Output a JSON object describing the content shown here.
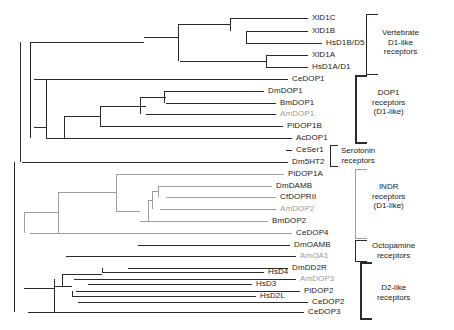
{
  "figure": {
    "type": "phylogenetic-tree",
    "width": 454,
    "height": 330,
    "colors": {
      "branch_dark": "#2b2b2b",
      "branch_gray": "#9d9d9d",
      "label_dark": "#1c1c1c",
      "label_gray": "#9a9a9a",
      "background": "#ffffff"
    }
  },
  "taxa": [
    {
      "id": "t0",
      "label": "XlD1C",
      "y": 18,
      "tip_x": 308,
      "label_x": 312,
      "color": "dark",
      "group": "vertebrate_d1"
    },
    {
      "id": "t1",
      "label": "XlD1B",
      "y": 31,
      "tip_x": 308,
      "label_x": 312,
      "color": "dark",
      "group": "vertebrate_d1"
    },
    {
      "id": "t2",
      "label": "HsD1B/D5",
      "y": 43,
      "tip_x": 322,
      "label_x": 326,
      "color": "dark",
      "group": "vertebrate_d1"
    },
    {
      "id": "t3",
      "label": "XlD1A",
      "y": 55,
      "tip_x": 308,
      "label_x": 312,
      "color": "dark",
      "group": "vertebrate_d1"
    },
    {
      "id": "t4",
      "label": "HsD1A/D1",
      "y": 67,
      "tip_x": 308,
      "label_x": 312,
      "color": "dark",
      "group": "vertebrate_d1"
    },
    {
      "id": "t5",
      "label": "CeDOP1",
      "y": 79,
      "tip_x": 288,
      "label_x": 292,
      "color": "dark",
      "group": "dop1"
    },
    {
      "id": "t6",
      "label": "DmDOP1",
      "y": 91,
      "tip_x": 264,
      "label_x": 268,
      "color": "dark",
      "group": "dop1"
    },
    {
      "id": "t7",
      "label": "BmDOP1",
      "y": 103,
      "tip_x": 276,
      "label_x": 280,
      "color": "dark",
      "group": "dop1"
    },
    {
      "id": "t8",
      "label": "AmDOP1",
      "y": 114,
      "tip_x": 276,
      "label_x": 280,
      "color": "gray",
      "group": "dop1"
    },
    {
      "id": "t9",
      "label": "PiDOP1B",
      "y": 126,
      "tip_x": 283,
      "label_x": 287,
      "color": "dark",
      "group": "dop1"
    },
    {
      "id": "t10",
      "label": "AcDOP1",
      "y": 138,
      "tip_x": 292,
      "label_x": 296,
      "color": "dark",
      "group": "dop1"
    },
    {
      "id": "t11",
      "label": "CeSer1",
      "y": 150,
      "tip_x": 292,
      "label_x": 296,
      "color": "dark",
      "group": "serotonin"
    },
    {
      "id": "t12",
      "label": "Dm5HT2",
      "y": 162,
      "tip_x": 288,
      "label_x": 292,
      "color": "dark",
      "group": "serotonin"
    },
    {
      "id": "t13",
      "label": "PiDOP1A",
      "y": 174,
      "tip_x": 284,
      "label_x": 288,
      "color": "dark",
      "group": "indr"
    },
    {
      "id": "t14",
      "label": "DmDAMB",
      "y": 186,
      "tip_x": 272,
      "label_x": 276,
      "color": "dark",
      "group": "indr"
    },
    {
      "id": "t15",
      "label": "CfDOPRII",
      "y": 197,
      "tip_x": 276,
      "label_x": 280,
      "color": "dark",
      "group": "indr"
    },
    {
      "id": "t16",
      "label": "AmDOP2",
      "y": 209,
      "tip_x": 276,
      "label_x": 280,
      "color": "gray",
      "group": "indr"
    },
    {
      "id": "t17",
      "label": "BmDOP2",
      "y": 221,
      "tip_x": 268,
      "label_x": 272,
      "color": "dark",
      "group": "indr"
    },
    {
      "id": "t18",
      "label": "CeDOP4",
      "y": 233,
      "tip_x": 292,
      "label_x": 296,
      "color": "dark",
      "group": "indr"
    },
    {
      "id": "t19",
      "label": "DmOAMB",
      "y": 245,
      "tip_x": 290,
      "label_x": 294,
      "color": "dark",
      "group": "octopamine"
    },
    {
      "id": "t20",
      "label": "AmOA1",
      "y": 256,
      "tip_x": 296,
      "label_x": 300,
      "color": "gray",
      "group": "octopamine"
    },
    {
      "id": "t21",
      "label": "DmDD2R",
      "y": 268,
      "tip_x": 288,
      "label_x": 292,
      "color": "dark",
      "group": "d2like"
    },
    {
      "id": "t22",
      "label": "AmDOP3",
      "y": 279,
      "tip_x": 296,
      "label_x": 300,
      "color": "gray",
      "group": "d2like"
    },
    {
      "id": "t23",
      "label": "PiDOP2",
      "y": 291,
      "tip_x": 300,
      "label_x": 304,
      "color": "dark",
      "group": "d2like"
    },
    {
      "id": "t24",
      "label": "CeDOP2",
      "y": 302,
      "tip_x": 308,
      "label_x": 312,
      "color": "dark",
      "group": "d2like"
    },
    {
      "id": "t25",
      "label": "HsD4",
      "y": 272,
      "tip_x": 264,
      "label_x": 268,
      "color": "dark",
      "group": "d2like"
    },
    {
      "id": "t26",
      "label": "HsD3",
      "y": 284,
      "tip_x": 252,
      "label_x": 256,
      "color": "dark",
      "group": "d2like"
    },
    {
      "id": "t27",
      "label": "HsD2L",
      "y": 296,
      "tip_x": 256,
      "label_x": 260,
      "color": "dark",
      "group": "d2like"
    },
    {
      "id": "t28",
      "label": "CeDOP3",
      "y": 312,
      "tip_x": 304,
      "label_x": 308,
      "color": "dark",
      "group": "d2like"
    }
  ],
  "groups": [
    {
      "id": "vertebrate_d1",
      "label": "Vertebrate\nD1-like\nreceptors",
      "bracket_top": 14,
      "bracket_bottom": 75,
      "bracket_x": 366,
      "bracket_w": 12,
      "label_x": 382,
      "label_y": 28,
      "color": "dark",
      "thick": false
    },
    {
      "id": "dop1",
      "label": "DOP1\nreceptors\n(D1-like)",
      "bracket_top": 75,
      "bracket_bottom": 144,
      "bracket_x": 355,
      "bracket_w": 12,
      "label_x": 372,
      "label_y": 88,
      "color": "dark",
      "thick": true
    },
    {
      "id": "serotonin",
      "label": "Serotonin\nreceptors",
      "bracket_top": 145,
      "bracket_bottom": 167,
      "bracket_x": 330,
      "bracket_w": 8,
      "label_x": 341,
      "label_y": 146,
      "color": "dark",
      "thick": false
    },
    {
      "id": "indr",
      "label": "INDR\nreceptors\n(D1-like)",
      "bracket_top": 169,
      "bracket_bottom": 239,
      "bracket_x": 355,
      "bracket_w": 12,
      "label_x": 372,
      "label_y": 182,
      "color": "gray",
      "thick": false
    },
    {
      "id": "octopamine",
      "label": "Octopamine\nreceptors",
      "bracket_top": 240,
      "bracket_bottom": 262,
      "bracket_x": 355,
      "bracket_w": 12,
      "label_x": 372,
      "label_y": 241,
      "color": "dark",
      "thick": false
    },
    {
      "id": "d2like",
      "label": "D2-like\nreceptors",
      "bracket_top": 262,
      "bracket_bottom": 320,
      "bracket_x": 360,
      "bracket_w": 12,
      "label_x": 377,
      "label_y": 283,
      "color": "dark",
      "thick": true
    }
  ],
  "tree": {
    "h_branches": [
      {
        "id": "h-t0",
        "x": 230,
        "y": 18,
        "w": 78,
        "c": "dark"
      },
      {
        "id": "h-t1",
        "x": 246,
        "y": 31,
        "w": 62,
        "c": "dark"
      },
      {
        "id": "h-t2",
        "x": 246,
        "y": 43,
        "w": 76,
        "c": "dark"
      },
      {
        "id": "h-t3",
        "x": 266,
        "y": 55,
        "w": 42,
        "c": "dark"
      },
      {
        "id": "h-t4",
        "x": 266,
        "y": 67,
        "w": 42,
        "c": "dark"
      },
      {
        "id": "h-n01",
        "x": 178,
        "y": 24,
        "w": 52,
        "c": "dark"
      },
      {
        "id": "h-n012",
        "x": 144,
        "y": 37,
        "w": 34,
        "c": "dark"
      },
      {
        "id": "h-n34",
        "x": 180,
        "y": 61,
        "w": 86,
        "c": "dark"
      },
      {
        "id": "h-vertroot",
        "x": 30,
        "y": 42,
        "w": 114,
        "c": "dark"
      },
      {
        "id": "h-t5",
        "x": 34,
        "y": 79,
        "w": 254,
        "c": "dark"
      },
      {
        "id": "h-t6",
        "x": 164,
        "y": 91,
        "w": 100,
        "c": "dark"
      },
      {
        "id": "h-t7",
        "x": 166,
        "y": 103,
        "w": 110,
        "c": "dark"
      },
      {
        "id": "h-t8",
        "x": 146,
        "y": 114,
        "w": 130,
        "c": "dark"
      },
      {
        "id": "h-t9",
        "x": 100,
        "y": 126,
        "w": 183,
        "c": "dark"
      },
      {
        "id": "h-t10",
        "x": 46,
        "y": 138,
        "w": 246,
        "c": "dark"
      },
      {
        "id": "h-n67",
        "x": 140,
        "y": 97,
        "w": 26,
        "c": "dark"
      },
      {
        "id": "h-n678",
        "x": 100,
        "y": 106,
        "w": 46,
        "c": "dark"
      },
      {
        "id": "h-n6789",
        "x": 64,
        "y": 116,
        "w": 36,
        "c": "dark"
      },
      {
        "id": "h-dop1root",
        "x": 34,
        "y": 127,
        "w": 12,
        "c": "dark"
      },
      {
        "id": "h-t11",
        "x": 286,
        "y": 150,
        "w": 6,
        "c": "dark"
      },
      {
        "id": "h-t12",
        "x": 22,
        "y": 162,
        "w": 266,
        "c": "dark"
      },
      {
        "id": "h-t13",
        "x": 116,
        "y": 174,
        "w": 168,
        "c": "gray"
      },
      {
        "id": "h-t14",
        "x": 158,
        "y": 186,
        "w": 114,
        "c": "gray"
      },
      {
        "id": "h-t15",
        "x": 166,
        "y": 197,
        "w": 110,
        "c": "gray"
      },
      {
        "id": "h-t16",
        "x": 160,
        "y": 209,
        "w": 116,
        "c": "gray"
      },
      {
        "id": "h-t17",
        "x": 140,
        "y": 221,
        "w": 128,
        "c": "gray"
      },
      {
        "id": "h-t18",
        "x": 30,
        "y": 233,
        "w": 262,
        "c": "gray"
      },
      {
        "id": "h-n1415",
        "x": 152,
        "y": 191,
        "w": 6,
        "c": "gray"
      },
      {
        "id": "h-n141516",
        "x": 148,
        "y": 200,
        "w": 4,
        "c": "gray"
      },
      {
        "id": "h-n14151617",
        "x": 116,
        "y": 211,
        "w": 24,
        "c": "gray"
      },
      {
        "id": "h-nindr",
        "x": 58,
        "y": 192,
        "w": 58,
        "c": "gray"
      },
      {
        "id": "h-indrroot",
        "x": 24,
        "y": 212,
        "w": 34,
        "c": "gray"
      },
      {
        "id": "h-t19",
        "x": 138,
        "y": 245,
        "w": 152,
        "c": "dark"
      },
      {
        "id": "h-t20",
        "x": 66,
        "y": 256,
        "w": 230,
        "c": "dark"
      },
      {
        "id": "h-t21",
        "x": 128,
        "y": 268,
        "w": 160,
        "c": "dark"
      },
      {
        "id": "h-t22",
        "x": 74,
        "y": 279,
        "w": 222,
        "c": "dark"
      },
      {
        "id": "h-t23",
        "x": 76,
        "y": 291,
        "w": 224,
        "c": "dark"
      },
      {
        "id": "h-t24",
        "x": 78,
        "y": 302,
        "w": 230,
        "c": "dark"
      },
      {
        "id": "h-t25",
        "x": 102,
        "y": 272,
        "w": 162,
        "c": "dark"
      },
      {
        "id": "h-t26",
        "x": 88,
        "y": 284,
        "w": 164,
        "c": "dark"
      },
      {
        "id": "h-t27",
        "x": 72,
        "y": 296,
        "w": 184,
        "c": "dark"
      },
      {
        "id": "h-t28",
        "x": 28,
        "y": 312,
        "w": 276,
        "c": "dark"
      },
      {
        "id": "h-d2a",
        "x": 62,
        "y": 274,
        "w": 40,
        "c": "dark"
      },
      {
        "id": "h-d2b",
        "x": 54,
        "y": 286,
        "w": 18,
        "c": "dark"
      },
      {
        "id": "h-d2root",
        "x": 24,
        "y": 288,
        "w": 30,
        "c": "dark"
      }
    ],
    "v_branches": [
      {
        "id": "v-n01",
        "x": 230,
        "y": 18,
        "h": 13,
        "c": "dark"
      },
      {
        "id": "v-n12",
        "x": 246,
        "y": 31,
        "h": 12,
        "c": "dark"
      },
      {
        "id": "v-n34",
        "x": 266,
        "y": 55,
        "h": 12,
        "c": "dark"
      },
      {
        "id": "v-vert",
        "x": 178,
        "y": 24,
        "h": 37,
        "c": "dark"
      },
      {
        "id": "v-n67",
        "x": 164,
        "y": 91,
        "h": 12,
        "c": "dark"
      },
      {
        "id": "v-n678",
        "x": 140,
        "y": 97,
        "h": 17,
        "c": "dark"
      },
      {
        "id": "v-n6789",
        "x": 100,
        "y": 106,
        "h": 20,
        "c": "dark"
      },
      {
        "id": "v-dop1a",
        "x": 64,
        "y": 116,
        "h": 22,
        "c": "dark"
      },
      {
        "id": "v-dop1b",
        "x": 46,
        "y": 79,
        "h": 59,
        "c": "dark"
      },
      {
        "id": "v-n1415",
        "x": 158,
        "y": 186,
        "h": 11,
        "c": "gray"
      },
      {
        "id": "v-n141516",
        "x": 152,
        "y": 191,
        "h": 18,
        "c": "gray"
      },
      {
        "id": "v-n14151617",
        "x": 148,
        "y": 200,
        "h": 21,
        "c": "gray"
      },
      {
        "id": "v-indra",
        "x": 116,
        "y": 174,
        "h": 37,
        "c": "gray"
      },
      {
        "id": "v-indrb",
        "x": 58,
        "y": 192,
        "h": 41,
        "c": "gray"
      },
      {
        "id": "v-d2a",
        "x": 102,
        "y": 268,
        "h": 4,
        "c": "dark"
      },
      {
        "id": "v-d2b",
        "x": 62,
        "y": 274,
        "h": 12,
        "c": "dark"
      },
      {
        "id": "v-d2c",
        "x": 72,
        "y": 291,
        "h": 5,
        "c": "dark"
      },
      {
        "id": "v-d2d",
        "x": 54,
        "y": 279,
        "h": 33,
        "c": "dark"
      },
      {
        "id": "v-root-main",
        "x": 20,
        "y": 42,
        "h": 120,
        "c": "dark"
      },
      {
        "id": "v-root-low",
        "x": 14,
        "y": 162,
        "h": 150,
        "c": "dark"
      },
      {
        "id": "v-deep",
        "x": 30,
        "y": 42,
        "h": 96,
        "c": "dark"
      },
      {
        "id": "v-indrdeep",
        "x": 24,
        "y": 212,
        "h": 21,
        "c": "gray"
      }
    ]
  }
}
